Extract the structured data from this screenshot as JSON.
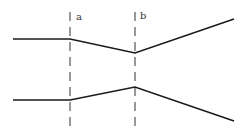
{
  "diagram": {
    "colors": {
      "line": "#1a1a1a",
      "dashed": "#333333",
      "label": "#333333",
      "background": "#ffffff"
    },
    "markers": [
      {
        "id": "a",
        "label": "a",
        "x": 70
      },
      {
        "id": "b",
        "label": "b",
        "x": 135
      }
    ],
    "polylines": [
      {
        "name": "upper-line",
        "points": "13,39 70,39 135,53 234,19"
      },
      {
        "name": "lower-line",
        "points": "13,100 70,100 135,87 234,121"
      }
    ]
  }
}
